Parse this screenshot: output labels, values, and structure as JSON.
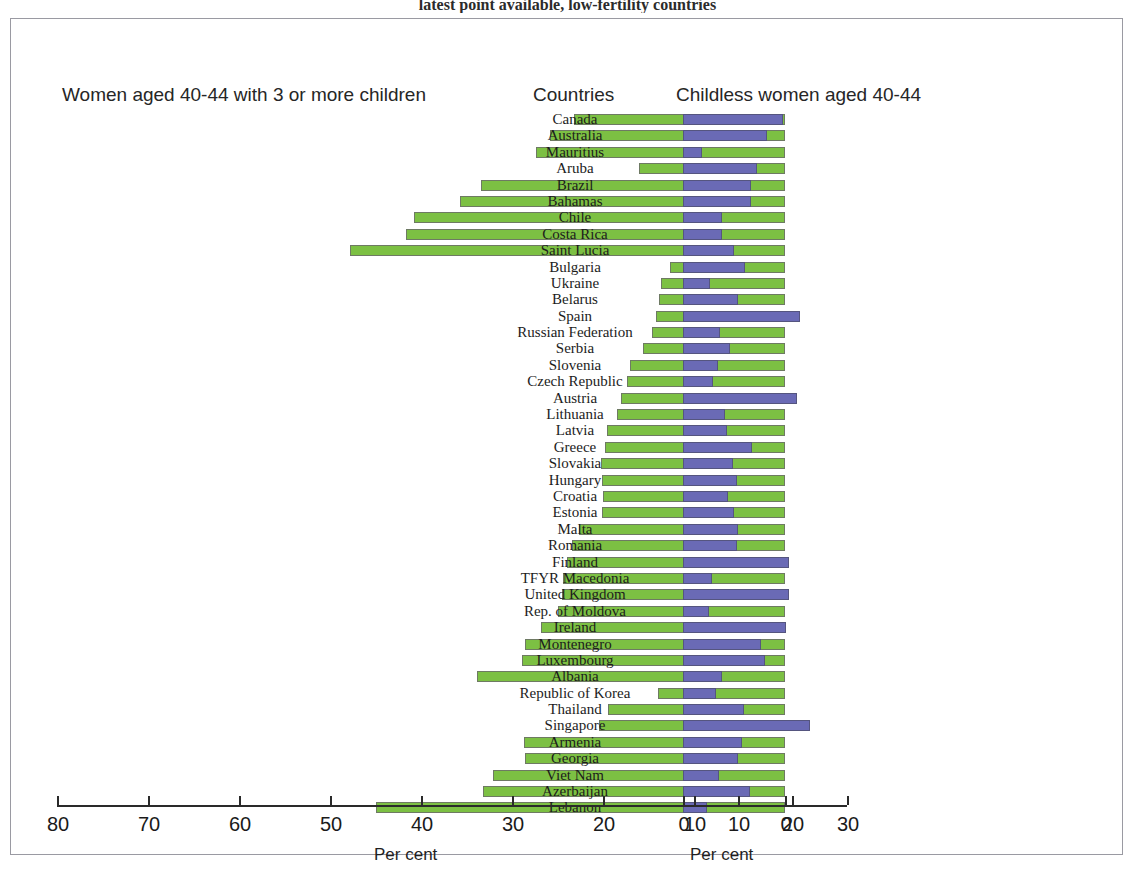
{
  "figure": {
    "caption": "latest point available, low-fertility countries"
  },
  "panels": {
    "left_title": "Women aged 40-44 with 3 or more children",
    "middle_title": "Countries",
    "right_title": "Childless women aged 40-44"
  },
  "axes": {
    "left": {
      "caption": "Per cent",
      "ticks": [
        "80",
        "70",
        "60",
        "50",
        "40",
        "30",
        "20",
        "10",
        "0"
      ]
    },
    "right": {
      "caption": "Per cent",
      "ticks": [
        "0",
        "10",
        "20",
        "30"
      ]
    }
  },
  "colors": {
    "green_bar": "#7cc043",
    "blue_bar": "#6a6ab5",
    "frame": "#9a9aa2"
  },
  "chart_data": {
    "type": "bar",
    "title": "latest point available, low-fertility countries",
    "orientation": "horizontal",
    "layout": "back-to-back population pyramid style, two panels sharing country rows",
    "xlabel": "Per cent",
    "ylabel": "Countries",
    "grid": false,
    "legend": "none",
    "panels": [
      {
        "name": "Women aged 40-44 with 3 or more children",
        "color": "#7cc043",
        "direction": "right-to-left",
        "xlim": [
          80,
          0
        ],
        "xticks": [
          80,
          70,
          60,
          50,
          40,
          30,
          20,
          10,
          0
        ]
      },
      {
        "name": "Childless women aged 40-44",
        "color": "#6a6ab5",
        "direction": "left-to-right",
        "xlim": [
          0,
          30
        ],
        "xticks": [
          0,
          10,
          20,
          30
        ]
      }
    ],
    "categories": [
      "Canada",
      "Australia",
      "Mauritius",
      "Aruba",
      "Brazil",
      "Bahamas",
      "Chile",
      "Costa Rica",
      "Saint Lucia",
      "Bulgaria",
      "Ukraine",
      "Belarus",
      "Spain",
      "Russian Federation",
      "Serbia",
      "Slovenia",
      "Czech Republic",
      "Austria",
      "Lithuania",
      "Latvia",
      "Greece",
      "Slovakia",
      "Hungary",
      "Croatia",
      "Estonia",
      "Malta",
      "Romania",
      "Finland",
      "TFYR Macedonia",
      "United Kingdom",
      "Rep. of Moldova",
      "Ireland",
      "Montenegro",
      "Luxembourg",
      "Albania",
      "Republic of Korea",
      "Thailand",
      "Singapore",
      "Armenia",
      "Georgia",
      "Viet Nam",
      "Azerbaijan",
      "Lebanon"
    ],
    "series": [
      {
        "name": "Women aged 40-44 with 3 or more children",
        "values": [
          23.2,
          25.8,
          27.4,
          16.0,
          33.4,
          35.7,
          40.8,
          41.6,
          47.8,
          12.6,
          13.6,
          13.8,
          14.2,
          14.6,
          15.6,
          17.0,
          17.4,
          18.0,
          18.5,
          19.6,
          19.8,
          20.2,
          20.1,
          20.0,
          20.1,
          22.6,
          23.4,
          24.0,
          24.4,
          24.5,
          25.0,
          26.8,
          28.6,
          28.9,
          33.9,
          14.0,
          19.5,
          20.4,
          28.7,
          28.6,
          32.1,
          33.2,
          45.0
        ]
      },
      {
        "name": "Childless women aged 40-44",
        "values": [
          18.4,
          15.3,
          3.4,
          13.6,
          12.5,
          12.5,
          7.1,
          7.1,
          9.3,
          11.3,
          4.9,
          10.0,
          21.5,
          6.8,
          8.6,
          6.4,
          5.5,
          20.8,
          7.7,
          8.0,
          12.6,
          9.1,
          9.9,
          8.2,
          9.3,
          10.0,
          9.9,
          19.5,
          5.3,
          19.4,
          4.8,
          18.8,
          14.3,
          15.0,
          7.1,
          6.0,
          11.1,
          23.2,
          10.8,
          10.0,
          6.6,
          12.2,
          4.4
        ]
      }
    ]
  }
}
